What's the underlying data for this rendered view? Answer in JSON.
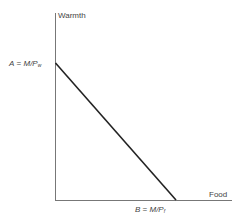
{
  "diagram": {
    "y_axis_label": "Warmth",
    "x_axis_label": "Food",
    "intercept_a": {
      "name": "A",
      "eq": "=",
      "expr": "M/P",
      "sub": "w"
    },
    "intercept_b": {
      "name": "B",
      "eq": "=",
      "expr": "M/P",
      "sub": "f"
    },
    "line_color": "#222222"
  }
}
